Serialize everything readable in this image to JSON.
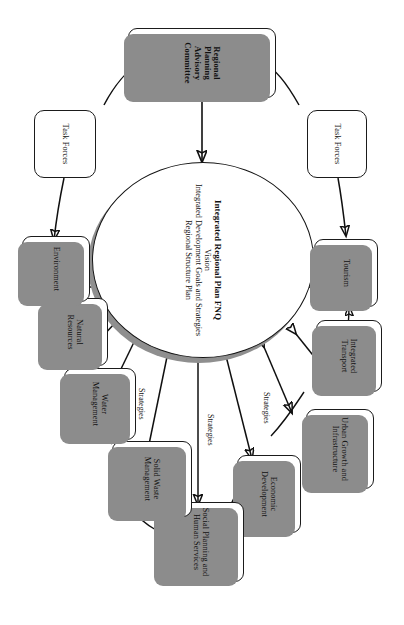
{
  "diagram": {
    "type": "flow-diagram",
    "orientation": "rotated-90-clockwise",
    "center": {
      "line1": "Integrated Regional Plan FNQ",
      "line2": "Vision",
      "line3": "Integrated Development Goals and Strategies",
      "line4": "Regional Structure Plan"
    },
    "governance": {
      "committee": "Regional Planning Advisory Committee",
      "task_force_top": "Task Forces",
      "task_force_bottom": "Task Forces"
    },
    "themes": [
      {
        "id": "tourism",
        "label": "Tourism"
      },
      {
        "id": "integrated-transport",
        "label": "Integrated Transport"
      },
      {
        "id": "urban-growth",
        "label": "Urban Growth and Infrastructure"
      },
      {
        "id": "economic-development",
        "label": "Economic Development"
      },
      {
        "id": "social-planning",
        "label": "Social Planning and Human Services"
      },
      {
        "id": "solid-waste",
        "label": "Solid Waste Management"
      },
      {
        "id": "water-management",
        "label": "Water Management"
      },
      {
        "id": "natural-resources",
        "label": "Natural Resources"
      },
      {
        "id": "environment",
        "label": "Environment"
      }
    ],
    "edge_labels": {
      "strategies_top": "Strategies",
      "strategies_middle": "Strategies",
      "strategies_bottom": "Strategies"
    },
    "colors": {
      "outline": "#131313",
      "shadow": "#8c8c8c",
      "background": "#ffffff",
      "text": "#111111"
    }
  }
}
